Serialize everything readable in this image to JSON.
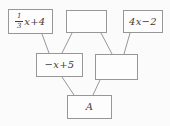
{
  "diagram": {
    "boxes": {
      "top_left": {
        "numerator": "1",
        "denominator": "3",
        "rest": "x+4"
      },
      "top_middle": {
        "label": ""
      },
      "top_right": {
        "label": "4x−2"
      },
      "mid_left": {
        "label": "−x+5"
      },
      "mid_right": {
        "label": ""
      },
      "bottom": {
        "label": "A"
      }
    },
    "colors": {
      "border": "#979797",
      "text": "#3d3d3d",
      "background": "#fbfbfb"
    },
    "edges": [
      {
        "x1": 42,
        "y1": 34,
        "x2": 49,
        "y2": 53
      },
      {
        "x1": 72,
        "y1": 33,
        "x2": 62,
        "y2": 53
      },
      {
        "x1": 101,
        "y1": 33,
        "x2": 112,
        "y2": 54
      },
      {
        "x1": 130,
        "y1": 33,
        "x2": 124,
        "y2": 54
      },
      {
        "x1": 62,
        "y1": 77,
        "x2": 74,
        "y2": 95
      },
      {
        "x1": 100,
        "y1": 80,
        "x2": 93,
        "y2": 95
      }
    ]
  }
}
